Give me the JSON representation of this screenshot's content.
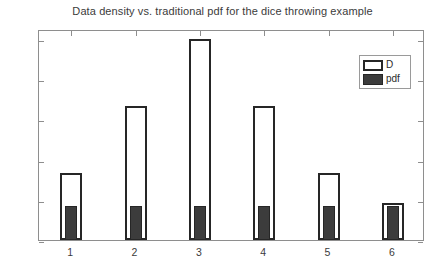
{
  "chart_data": {
    "type": "bar",
    "title": "Data density vs. traditional pdf for the dice throwing example",
    "xlabel": "",
    "ylabel": "",
    "categories": [
      "1",
      "2",
      "3",
      "4",
      "5",
      "6"
    ],
    "series": [
      {
        "name": "D",
        "values": [
          0.333,
          0.667,
          1.0,
          0.667,
          0.333,
          0.185
        ],
        "style": "hollow-outline",
        "color": "#ffffff",
        "edge_color": "#262626"
      },
      {
        "name": "pdf",
        "values": [
          0.167,
          0.167,
          0.167,
          0.167,
          0.167,
          0.167
        ],
        "style": "filled",
        "color": "#3c3c3c",
        "edge_color": "#262626"
      }
    ],
    "ylim": [
      0,
      1.05
    ],
    "ytick_values": [
      0,
      0.2,
      0.4,
      0.6,
      0.8,
      1
    ],
    "ytick_labels": [
      "0",
      "0.2",
      "0.4",
      "0.6",
      "0.8",
      "1"
    ],
    "xtick_labels": [
      "1",
      "2",
      "3",
      "4",
      "5",
      "6"
    ],
    "grid": false,
    "legend_position": "top-right",
    "legend_entries": [
      "D",
      "pdf"
    ],
    "axis_color": "#8e8e8e",
    "background": "#ffffff"
  }
}
